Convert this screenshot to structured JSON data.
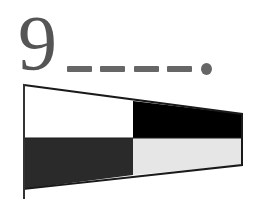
{
  "numeral": {
    "label": "9",
    "morse_code": "----.",
    "morse_symbols": [
      "dash",
      "dash",
      "dash",
      "dash",
      "dot"
    ]
  },
  "flag": {
    "type": "pennant-tapered",
    "quadrants": {
      "top_left": "#ffffff",
      "top_right": "#000000",
      "bottom_left": "#2a2a2a",
      "bottom_right": "#e6e6e6"
    },
    "outline": "#1a1a1a"
  },
  "colors": {
    "text": "#555555",
    "morse": "#666666"
  }
}
